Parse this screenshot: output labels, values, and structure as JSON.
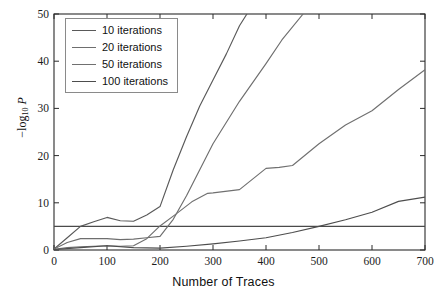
{
  "chart_data": {
    "type": "line",
    "title": "",
    "xlabel": "Number of Traces",
    "ylabel": "− log10 P",
    "ylabel_parts": {
      "minus": "−",
      "base": "log",
      "sub": "10",
      "var": "P"
    },
    "xlim": [
      0,
      700
    ],
    "ylim": [
      0,
      50
    ],
    "xticks": [
      0,
      100,
      200,
      300,
      400,
      500,
      600,
      700
    ],
    "yticks": [
      0,
      10,
      20,
      30,
      40,
      50
    ],
    "grid": false,
    "legend_position": "upper-left",
    "annotations": [
      {
        "type": "hline",
        "name": "significance-threshold",
        "y": 5,
        "color": "#4a4a4a"
      }
    ],
    "series": [
      {
        "name": "10 iterations",
        "color": "#595959",
        "x": [
          0,
          25,
          50,
          75,
          100,
          125,
          150,
          175,
          200,
          225,
          250,
          275,
          300,
          325,
          350,
          364
        ],
        "y": [
          0.2,
          2.6,
          5.0,
          6.0,
          6.9,
          6.2,
          6.1,
          7.4,
          9.2,
          17.0,
          24.0,
          30.5,
          36.0,
          41.5,
          47.5,
          50.0
        ]
      },
      {
        "name": "20 iterations",
        "color": "#6e6e6e",
        "x": [
          0,
          25,
          50,
          75,
          100,
          125,
          150,
          175,
          200,
          225,
          250,
          275,
          300,
          350,
          400,
          430,
          470
        ],
        "y": [
          0.2,
          1.6,
          2.4,
          2.4,
          2.4,
          2.2,
          2.3,
          2.6,
          2.9,
          6.5,
          11.5,
          17.0,
          22.5,
          31.5,
          39.5,
          44.5,
          50.0
        ]
      },
      {
        "name": "50 iterations",
        "color": "#707070",
        "x": [
          0,
          25,
          50,
          75,
          100,
          125,
          150,
          175,
          200,
          230,
          260,
          290,
          300,
          350,
          400,
          425,
          450,
          500,
          550,
          600,
          650,
          700
        ],
        "y": [
          0.15,
          0.5,
          0.7,
          0.8,
          0.9,
          0.8,
          0.9,
          2.4,
          5.1,
          7.6,
          10.2,
          12.0,
          12.1,
          12.8,
          17.3,
          17.5,
          17.9,
          22.5,
          26.5,
          29.5,
          34.0,
          38.2
        ]
      },
      {
        "name": "100 iterations",
        "color": "#4d4d4d",
        "x": [
          0,
          50,
          100,
          150,
          200,
          250,
          300,
          350,
          400,
          450,
          500,
          550,
          600,
          650,
          700
        ],
        "y": [
          0.1,
          0.5,
          0.9,
          0.5,
          0.4,
          0.8,
          1.3,
          1.9,
          2.6,
          3.7,
          5.0,
          6.4,
          8.0,
          10.3,
          11.2
        ]
      }
    ]
  },
  "legend": {
    "items": [
      {
        "label": "10 iterations",
        "color": "#595959"
      },
      {
        "label": "20 iterations",
        "color": "#6e6e6e"
      },
      {
        "label": "50 iterations",
        "color": "#707070"
      },
      {
        "label": "100 iterations",
        "color": "#4d4d4d"
      }
    ]
  },
  "axes": {
    "x_tick_labels": [
      "0",
      "100",
      "200",
      "300",
      "400",
      "500",
      "600",
      "700"
    ],
    "y_tick_labels": [
      "0",
      "10",
      "20",
      "30",
      "40",
      "50"
    ],
    "x_axis_title": "Number of Traces"
  },
  "colors": {
    "axis": "#2b2b2b",
    "background": "#ffffff",
    "text": "#111111",
    "threshold_line": "#4a4a4a"
  }
}
